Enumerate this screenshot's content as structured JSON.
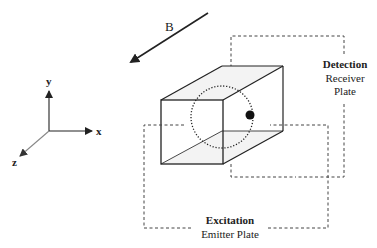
{
  "diagram": {
    "field_label": "B",
    "axes": {
      "x": "x",
      "y": "y",
      "z": "z"
    },
    "detection": {
      "title": "Detection",
      "line1": "Receiver",
      "line2": "Plate"
    },
    "excitation": {
      "title": "Excitation",
      "line1": "Emitter Plate"
    },
    "colors": {
      "stroke": "#222222",
      "dashed": "#444444",
      "shade": "#f2f2f2",
      "axis_z": "#888888"
    }
  }
}
